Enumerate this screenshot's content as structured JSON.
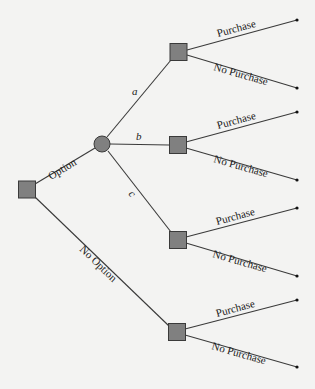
{
  "diagram": {
    "type": "decision-tree",
    "colors": {
      "background": "#f3f3f2",
      "node_fill": "#808080",
      "line": "#3a3a3a",
      "endpoint": "#111111"
    },
    "nodes": {
      "root": {
        "kind": "decision",
        "cx": 27,
        "cy": 189,
        "size": 17
      },
      "chance": {
        "kind": "chance",
        "cx": 102,
        "cy": 144,
        "r": 8
      },
      "dec_a": {
        "kind": "decision",
        "cx": 178,
        "cy": 52,
        "size": 17
      },
      "dec_b": {
        "kind": "decision",
        "cx": 178,
        "cy": 145,
        "size": 17
      },
      "dec_c": {
        "kind": "decision",
        "cx": 178,
        "cy": 240,
        "size": 17
      },
      "dec_no_option": {
        "kind": "decision",
        "cx": 177,
        "cy": 332,
        "size": 17
      }
    },
    "labels": {
      "option": "Option",
      "no_option": "No Option",
      "a": "a",
      "b": "b",
      "c": "c",
      "purchase": "Purchase",
      "no_purchase": "No Purchase"
    },
    "branches": [
      {
        "from": "root",
        "to": "chance",
        "label": "Option"
      },
      {
        "from": "root",
        "to": "dec_no_option",
        "label": "No Option"
      },
      {
        "from": "chance",
        "to": "dec_a",
        "label": "a"
      },
      {
        "from": "chance",
        "to": "dec_b",
        "label": "b"
      },
      {
        "from": "chance",
        "to": "dec_c",
        "label": "c"
      },
      {
        "from": "dec_a",
        "to": "end_1",
        "label": "Purchase"
      },
      {
        "from": "dec_a",
        "to": "end_2",
        "label": "No Purchase"
      },
      {
        "from": "dec_b",
        "to": "end_3",
        "label": "Purchase"
      },
      {
        "from": "dec_b",
        "to": "end_4",
        "label": "No Purchase"
      },
      {
        "from": "dec_c",
        "to": "end_5",
        "label": "Purchase"
      },
      {
        "from": "dec_c",
        "to": "end_6",
        "label": "No Purchase"
      },
      {
        "from": "dec_no_option",
        "to": "end_7",
        "label": "Purchase"
      },
      {
        "from": "dec_no_option",
        "to": "end_8",
        "label": "No Purchase"
      }
    ],
    "endpoints": [
      {
        "id": "end_1",
        "x": 297,
        "y": 20
      },
      {
        "id": "end_2",
        "x": 297,
        "y": 88
      },
      {
        "id": "end_3",
        "x": 297,
        "y": 112
      },
      {
        "id": "end_4",
        "x": 297,
        "y": 180
      },
      {
        "id": "end_5",
        "x": 297,
        "y": 208
      },
      {
        "id": "end_6",
        "x": 297,
        "y": 276
      },
      {
        "id": "end_7",
        "x": 297,
        "y": 300
      },
      {
        "id": "end_8",
        "x": 297,
        "y": 367
      }
    ]
  }
}
